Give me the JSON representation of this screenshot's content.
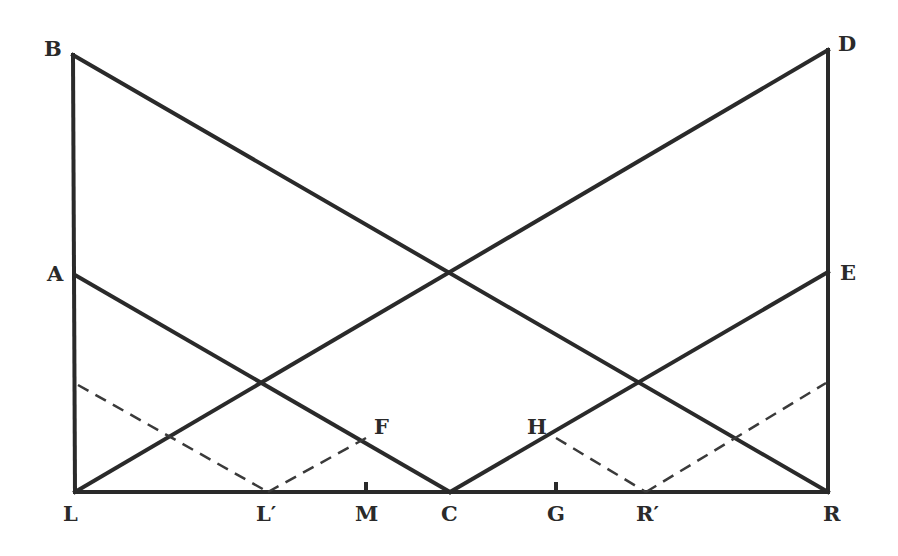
{
  "diagram": {
    "line_color": "#2a2a2a",
    "background": "#ffffff",
    "points": {
      "B": {
        "label": "B",
        "x": 73,
        "y": 55
      },
      "D": {
        "label": "D",
        "x": 828,
        "y": 50
      },
      "A": {
        "label": "A",
        "x": 75,
        "y": 275
      },
      "E": {
        "label": "E",
        "x": 828,
        "y": 272
      },
      "L": {
        "label": "L",
        "x": 75,
        "y": 492
      },
      "R": {
        "label": "R",
        "x": 828,
        "y": 492
      },
      "C": {
        "label": "C",
        "x": 450,
        "y": 492
      },
      "F": {
        "label": "F",
        "x": 366,
        "y": 440
      },
      "H": {
        "label": "H",
        "x": 556,
        "y": 440
      },
      "L_prime": {
        "label": "L′",
        "x": 268,
        "y": 492
      },
      "M": {
        "label": "M",
        "x": 366,
        "y": 492
      },
      "G": {
        "label": "G",
        "x": 556,
        "y": 492
      },
      "R_prime": {
        "label": "R′",
        "x": 646,
        "y": 492
      }
    },
    "solid_segments": [
      "L-B",
      "R-D",
      "L-R",
      "B-R",
      "L-D",
      "A-C",
      "C-E"
    ],
    "dashed_segments": [
      "left_start-L′",
      "L′-F",
      "H-R′",
      "R′-right_end"
    ],
    "tick_marks": [
      "M",
      "G"
    ]
  }
}
